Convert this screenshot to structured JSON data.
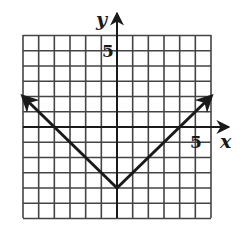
{
  "chart_data": {
    "type": "line",
    "title": "",
    "function": "y = |x| - 4",
    "xlabel": "x",
    "ylabel": "y",
    "xlim": [
      -6,
      6
    ],
    "ylim": [
      -6,
      6
    ],
    "grid": true,
    "grid_step": 1,
    "legend": null,
    "tick_labels": [
      {
        "axis": "y",
        "value": 5,
        "label": "5"
      },
      {
        "axis": "x",
        "value": 5,
        "label": "5"
      }
    ],
    "series": [
      {
        "name": "y = |x| - 4",
        "points": [
          [
            -6,
            2
          ],
          [
            0,
            -4
          ],
          [
            6,
            2
          ]
        ],
        "arrows_at_ends": true
      }
    ],
    "colors": {
      "grid": "#444444",
      "axes": "#1a1a1a",
      "curve": "#1a1a1a",
      "background": "#ffffff"
    }
  },
  "labels": {
    "x_axis": "x",
    "y_axis": "y",
    "x_tick": "5",
    "y_tick": "5"
  }
}
